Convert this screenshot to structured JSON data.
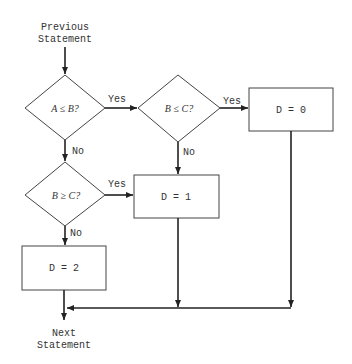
{
  "diagram": {
    "type": "flowchart",
    "start": {
      "line1": "Previous",
      "line2": "Statement"
    },
    "end": {
      "line1": "Next",
      "line2": "Statement"
    },
    "decisions": [
      {
        "id": "d1",
        "text": "A ≤ B?",
        "yes_label": "Yes",
        "no_label": "No"
      },
      {
        "id": "d2",
        "text": "B ≤ C?",
        "yes_label": "Yes",
        "no_label": "No"
      },
      {
        "id": "d3",
        "text": "B ≥ C?",
        "yes_label": "Yes",
        "no_label": "No"
      }
    ],
    "processes": [
      {
        "id": "p0",
        "text": "D = 0"
      },
      {
        "id": "p1",
        "text": "D = 1"
      },
      {
        "id": "p2",
        "text": "D = 2"
      }
    ],
    "edges": [
      {
        "from": "start",
        "to": "d1"
      },
      {
        "from": "d1",
        "to": "d2",
        "label": "Yes"
      },
      {
        "from": "d1",
        "to": "d3",
        "label": "No"
      },
      {
        "from": "d2",
        "to": "p0",
        "label": "Yes"
      },
      {
        "from": "d2",
        "to": "p1",
        "label": "No"
      },
      {
        "from": "d3",
        "to": "p1",
        "label": "Yes"
      },
      {
        "from": "d3",
        "to": "p2",
        "label": "No"
      },
      {
        "from": "p0",
        "to": "end"
      },
      {
        "from": "p1",
        "to": "end"
      },
      {
        "from": "p2",
        "to": "end"
      }
    ],
    "colors": {
      "line": "#222222",
      "background": "#ffffff"
    }
  }
}
